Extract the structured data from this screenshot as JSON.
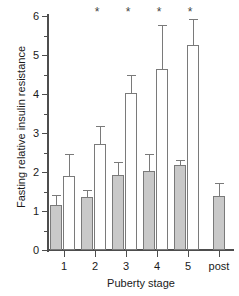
{
  "chart_data": {
    "type": "bar",
    "title": "",
    "xlabel": "Puberty stage",
    "ylabel": "Fasting relative insulin resistance",
    "categories": [
      "1",
      "2",
      "3",
      "4",
      "5",
      "post"
    ],
    "ylim": [
      0,
      6
    ],
    "ytick_labels": [
      "0",
      "1",
      "2",
      "3",
      "4",
      "5",
      "6"
    ],
    "ytick_values": [
      0,
      1,
      2,
      3,
      4,
      5,
      6
    ],
    "yminor_values": [
      0.5,
      1.5,
      2.5,
      3.5,
      4.5,
      5.5
    ],
    "grid": false,
    "legend": "none",
    "series": [
      {
        "name": "filled",
        "fill": "#c9c9c9",
        "values": [
          1.15,
          1.37,
          1.92,
          2.02,
          2.18,
          1.38
        ],
        "err_upper": [
          1.42,
          1.55,
          2.25,
          2.45,
          2.3,
          1.73
        ]
      },
      {
        "name": "open",
        "fill": "#ffffff",
        "values": [
          1.9,
          2.73,
          4.03,
          4.65,
          5.25,
          null
        ],
        "err_upper": [
          2.45,
          3.17,
          4.48,
          5.78,
          5.93,
          null
        ]
      }
    ],
    "annotations": [
      {
        "text": "*",
        "category": "2"
      },
      {
        "text": "*",
        "category": "3"
      },
      {
        "text": "*",
        "category": "4"
      },
      {
        "text": "*",
        "category": "5"
      }
    ]
  },
  "colors": {
    "axis": "#4d4d4d",
    "bar_edge": "#7a7a7a",
    "bar_filled": "#c9c9c9",
    "bar_open": "#ffffff",
    "text": "#1a1a1a"
  }
}
